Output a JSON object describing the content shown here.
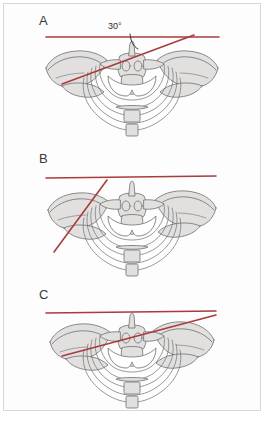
{
  "figure": {
    "background_color": "#fdfdfd",
    "border_color": "#d8d8d8",
    "reference_line_color": "#a83c3c",
    "bone_fill_color": "#e2e0df",
    "bone_outline_color": "#6f6f70",
    "label_color": "#3a3a3a"
  },
  "panels": [
    {
      "label": "A",
      "angle_label": "30°",
      "has_angle_arc": true,
      "subject": "pelvis-anteroposterior-view",
      "horizontal_line": {
        "x1": 42,
        "y1": 31,
        "x2": 215,
        "y2": 31
      },
      "oblique_line": {
        "x1": 58,
        "y1": 78,
        "x2": 190,
        "y2": 29
      }
    },
    {
      "label": "B",
      "angle_label": "",
      "has_angle_arc": false,
      "subject": "pelvis-anteroposterior-view",
      "horizontal_line": {
        "x1": 42,
        "y1": 34,
        "x2": 212,
        "y2": 32
      },
      "oblique_line": {
        "x1": 50,
        "y1": 108,
        "x2": 103,
        "y2": 36
      }
    },
    {
      "label": "C",
      "angle_label": "",
      "has_angle_arc": false,
      "subject": "pelvis-anteroposterior-view",
      "horizontal_line": {
        "x1": 42,
        "y1": 33,
        "x2": 212,
        "y2": 31
      },
      "oblique_line": {
        "x1": 58,
        "y1": 76,
        "x2": 212,
        "y2": 35
      }
    }
  ]
}
